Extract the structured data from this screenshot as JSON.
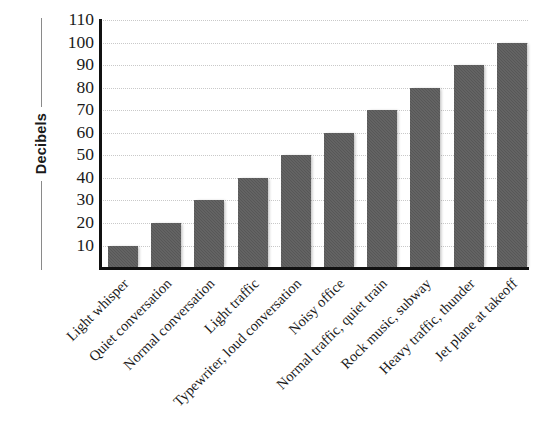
{
  "chart_data": {
    "type": "bar",
    "title": "",
    "xlabel": "",
    "ylabel": "Decibels",
    "ylim": [
      0,
      110
    ],
    "ytick_step": 10,
    "yticks": [
      110,
      100,
      90,
      80,
      70,
      60,
      50,
      40,
      30,
      20,
      10
    ],
    "grid": true,
    "legend": "none",
    "categories": [
      "Light whisper",
      "Quiet conversation",
      "Normal conversation",
      "Light traffic",
      "Typewriter, loud conversation",
      "Noisy office",
      "Normal traffic, quiet train",
      "Rock music, subway",
      "Heavy traffic, thunder",
      "Jet plane at takeoff"
    ],
    "values": [
      10,
      20,
      30,
      40,
      50,
      60,
      70,
      80,
      90,
      100
    ],
    "bar_color": "#575757",
    "gridline_color": "#c9c9c9",
    "axis_color": "#111111"
  },
  "axes": {
    "y_title": "Decibels"
  }
}
